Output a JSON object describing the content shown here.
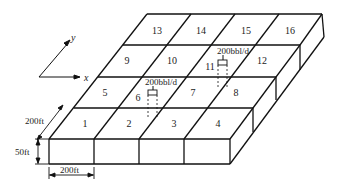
{
  "diagram": {
    "type": "reservoir-grid-block-diagram",
    "axes": {
      "x_label": "x",
      "y_label": "y"
    },
    "blocks": [
      {
        "id": "1",
        "label": "1"
      },
      {
        "id": "2",
        "label": "2"
      },
      {
        "id": "3",
        "label": "3"
      },
      {
        "id": "4",
        "label": "4"
      },
      {
        "id": "5",
        "label": "5"
      },
      {
        "id": "6",
        "label": "6"
      },
      {
        "id": "7",
        "label": "7"
      },
      {
        "id": "8",
        "label": "8"
      },
      {
        "id": "9",
        "label": "9"
      },
      {
        "id": "10",
        "label": "10"
      },
      {
        "id": "11",
        "label": "11"
      },
      {
        "id": "12",
        "label": "12"
      },
      {
        "id": "13",
        "label": "13"
      },
      {
        "id": "14",
        "label": "14"
      },
      {
        "id": "15",
        "label": "15"
      },
      {
        "id": "16",
        "label": "16"
      }
    ],
    "wells": [
      {
        "block": "6",
        "rate_label": "200bbl/d"
      },
      {
        "block": "11",
        "rate_label": "200bbl/d"
      }
    ],
    "dimensions": {
      "width_label": "200ft",
      "depth_label": "200ft",
      "thickness_label": "50ft"
    },
    "line_color": "#111111"
  }
}
